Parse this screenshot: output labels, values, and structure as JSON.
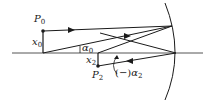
{
  "diagram": {
    "type": "ray-optics-concave-mirror",
    "labels": {
      "p0": {
        "base": "P",
        "sub": "0"
      },
      "x0": {
        "base": "x",
        "sub": "0"
      },
      "alpha0": {
        "base": "α",
        "sub": "0"
      },
      "x2": {
        "base": "x",
        "sub": "2"
      },
      "p2": {
        "base": "P",
        "sub": "2"
      },
      "alpha2": {
        "prefix": "(−)",
        "base": "α",
        "sub": "2"
      }
    },
    "colors": {
      "line": "#1a1a1a",
      "axis": "#555555",
      "background": "#ffffff"
    }
  }
}
